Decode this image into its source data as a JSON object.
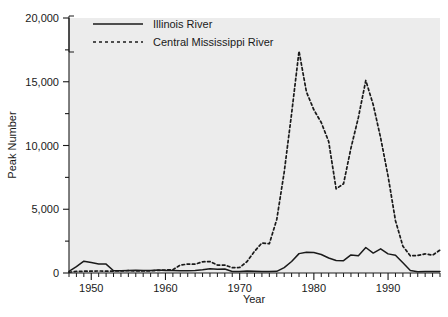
{
  "chart_data": {
    "type": "line",
    "title": "",
    "subtitle": "",
    "xlabel": "Year",
    "ylabel": "Peak Number",
    "xlim": [
      1947,
      1997
    ],
    "ylim": [
      0,
      20000
    ],
    "grid": false,
    "background_color": "#ececec",
    "line_color": "#1a1a1a",
    "legend_position": "top-left",
    "xticks": [
      1950,
      1960,
      1970,
      1980,
      1990
    ],
    "xtick_labels": [
      "1950",
      "1960",
      "1970",
      "1980",
      "1990"
    ],
    "xminor_step": 1,
    "yticks": [
      0,
      5000,
      10000,
      15000,
      20000
    ],
    "ytick_labels": [
      "0",
      "5,000",
      "10,000",
      "15,000",
      "20,000"
    ],
    "yminor_ticks": [
      2500,
      7500,
      12500,
      17500
    ],
    "x": [
      1947,
      1948,
      1949,
      1950,
      1951,
      1952,
      1953,
      1954,
      1955,
      1956,
      1957,
      1958,
      1959,
      1960,
      1961,
      1962,
      1963,
      1964,
      1965,
      1966,
      1967,
      1968,
      1969,
      1970,
      1971,
      1972,
      1973,
      1974,
      1975,
      1976,
      1977,
      1978,
      1979,
      1980,
      1981,
      1982,
      1983,
      1984,
      1985,
      1986,
      1987,
      1988,
      1989,
      1990,
      1991,
      1992,
      1993,
      1994,
      1995,
      1996,
      1997
    ],
    "series": [
      {
        "name": "Illinois River",
        "style": "solid",
        "color": "#1a1a1a",
        "values": [
          120,
          500,
          930,
          820,
          700,
          700,
          180,
          170,
          200,
          210,
          200,
          190,
          230,
          200,
          190,
          180,
          180,
          190,
          250,
          330,
          300,
          310,
          120,
          110,
          150,
          130,
          120,
          120,
          130,
          420,
          900,
          1520,
          1620,
          1600,
          1450,
          1180,
          980,
          970,
          1420,
          1350,
          2000,
          1560,
          1900,
          1500,
          1400,
          800,
          200,
          90,
          110,
          120,
          110
        ]
      },
      {
        "name": "Central Mississippi River",
        "style": "dashed",
        "color": "#1a1a1a",
        "values": [
          60,
          120,
          140,
          150,
          160,
          140,
          150,
          170,
          180,
          170,
          160,
          170,
          200,
          230,
          260,
          620,
          700,
          690,
          880,
          900,
          620,
          620,
          420,
          430,
          900,
          1700,
          2350,
          2300,
          4200,
          7900,
          12500,
          17400,
          14200,
          12800,
          11800,
          10300,
          6600,
          7000,
          9800,
          12200,
          15100,
          13200,
          10600,
          7600,
          4100,
          2100,
          1350,
          1380,
          1500,
          1400,
          1800
        ]
      }
    ]
  },
  "legend": {
    "entries": [
      {
        "label": "Illinois River",
        "style": "solid"
      },
      {
        "label": "Central Mississippi River",
        "style": "dashed"
      }
    ]
  },
  "axes": {
    "x_title": "Year",
    "y_title": "Peak Number"
  }
}
